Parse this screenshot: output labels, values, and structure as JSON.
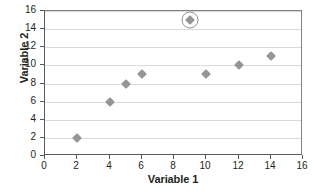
{
  "chart_data": {
    "type": "scatter",
    "title": "",
    "xlabel": "Variable 1",
    "ylabel": "Variable 2",
    "xlim": [
      0,
      16
    ],
    "ylim": [
      0,
      16
    ],
    "xticks": [
      0,
      2,
      4,
      6,
      8,
      10,
      12,
      14,
      16
    ],
    "yticks": [
      0,
      2,
      4,
      6,
      8,
      10,
      12,
      14,
      16
    ],
    "grid": "horizontal",
    "legend": "none",
    "marker_shape": "diamond",
    "marker_color": "#939598",
    "points": [
      {
        "x": 2,
        "y": 2,
        "highlighted": false
      },
      {
        "x": 4,
        "y": 6,
        "highlighted": false
      },
      {
        "x": 5,
        "y": 8,
        "highlighted": false
      },
      {
        "x": 6,
        "y": 9,
        "highlighted": false
      },
      {
        "x": 9,
        "y": 15,
        "highlighted": true
      },
      {
        "x": 10,
        "y": 9,
        "highlighted": false
      },
      {
        "x": 12,
        "y": 10,
        "highlighted": false
      },
      {
        "x": 14,
        "y": 11,
        "highlighted": false
      }
    ],
    "annotations": [
      {
        "type": "circle-highlight",
        "x": 9,
        "y": 15,
        "color": "#939598"
      }
    ]
  },
  "axes": {
    "x_title": "Variable 1",
    "y_title": "Variable 2",
    "x_tick_labels": [
      "0",
      "2",
      "4",
      "6",
      "8",
      "10",
      "12",
      "14",
      "16"
    ],
    "y_tick_labels": [
      "0",
      "2",
      "4",
      "6",
      "8",
      "10",
      "12",
      "14",
      "16"
    ]
  },
  "colors": {
    "marker": "#939598",
    "gridline": "#d9dadb",
    "axis": "#58595b",
    "text": "#231f20",
    "background": "#ffffff"
  }
}
